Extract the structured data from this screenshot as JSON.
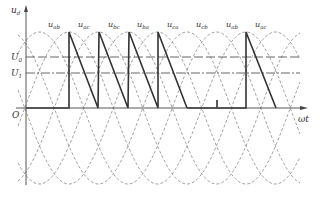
{
  "diagram": {
    "y_axis": {
      "label_main": "u",
      "label_sub": "d"
    },
    "x_axis": {
      "label": "ωt"
    },
    "origin_label": "O",
    "levels": [
      {
        "label_main": "U",
        "label_sub": "0",
        "style": "dashed"
      },
      {
        "label_main": "U",
        "label_sub": "1",
        "style": "dash-dot"
      }
    ],
    "waveform_labels": [
      {
        "main": "u",
        "sub": "ab"
      },
      {
        "main": "u",
        "sub": "ac"
      },
      {
        "main": "u",
        "sub": "bc"
      },
      {
        "main": "u",
        "sub": "ba"
      },
      {
        "main": "u",
        "sub": "ca"
      },
      {
        "main": "u",
        "sub": "cb"
      },
      {
        "main": "u",
        "sub": "ab"
      },
      {
        "main": "u",
        "sub": "ac"
      }
    ],
    "colors": {
      "axis": "#444444",
      "dashed": "#888888",
      "bold": "#333333",
      "text": "#333333"
    }
  }
}
